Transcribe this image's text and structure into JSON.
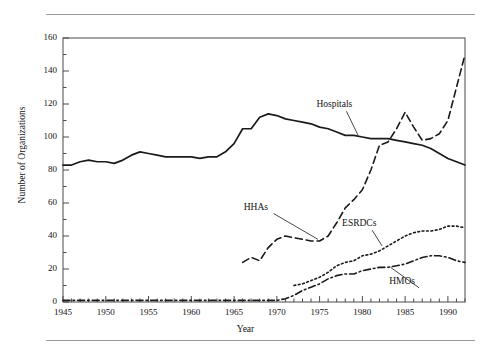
{
  "figure": {
    "ylabel": "Number of Organizations",
    "xlabel": "Year"
  },
  "chart_data": {
    "type": "line",
    "title": "",
    "xlabel": "Year",
    "ylabel": "Number of Organizations",
    "xlim": [
      1945,
      1992
    ],
    "ylim": [
      0,
      160
    ],
    "grid": false,
    "legend_position": "inline-annotations",
    "x_ticks": [
      1945,
      1950,
      1955,
      1960,
      1965,
      1970,
      1975,
      1980,
      1985,
      1990
    ],
    "x_tick_labels": [
      "1945",
      "1950",
      "1955",
      "1960",
      "1965",
      "1970",
      "1975",
      "1980",
      "1985",
      "1990"
    ],
    "x_minor_tick_step": 1,
    "y_ticks": [
      0,
      20,
      40,
      60,
      80,
      100,
      120,
      140,
      160
    ],
    "y_tick_labels": [
      "0",
      "20",
      "40",
      "60",
      "80",
      "100",
      "120",
      "140",
      "160"
    ],
    "y_minor_tick_step": 10,
    "annotations": [
      {
        "label": "Hospitals",
        "x": 1976.5,
        "y": 118,
        "leader_to_x": 1979.5,
        "leader_to_y": 101
      },
      {
        "label": "HHAs",
        "x": 1968.0,
        "y": 56,
        "leader_to_x": 1974.8,
        "leader_to_y": 38
      },
      {
        "label": "ESRDCs",
        "x": 1979.5,
        "y": 46,
        "leader_to_x": 1982.3,
        "leader_to_y": 34
      },
      {
        "label": "HMOs",
        "x": 1985.0,
        "y": 11,
        "leader_to_x": 1983.3,
        "leader_to_y": 21
      }
    ],
    "series": [
      {
        "name": "Hospitals",
        "style": "solid",
        "color": "#1a1a1a",
        "x": [
          1945,
          1946,
          1947,
          1948,
          1949,
          1950,
          1951,
          1952,
          1953,
          1954,
          1955,
          1956,
          1957,
          1958,
          1959,
          1960,
          1961,
          1962,
          1963,
          1964,
          1965,
          1966,
          1967,
          1968,
          1969,
          1970,
          1971,
          1972,
          1973,
          1974,
          1975,
          1976,
          1977,
          1978,
          1979,
          1980,
          1981,
          1982,
          1983,
          1984,
          1985,
          1986,
          1987,
          1988,
          1989,
          1990,
          1991,
          1992
        ],
        "values": [
          83,
          83,
          85,
          86,
          85,
          85,
          84,
          86,
          89,
          91,
          90,
          89,
          88,
          88,
          88,
          88,
          87,
          88,
          88,
          91,
          96,
          105,
          105,
          112,
          114,
          113,
          111,
          110,
          109,
          108,
          106,
          105,
          103,
          101,
          101,
          100,
          99,
          99,
          99,
          98,
          97,
          96,
          95,
          93,
          90,
          87,
          85,
          83
        ]
      },
      {
        "name": "HHAs",
        "style": "dashed",
        "color": "#1a1a1a",
        "x": [
          1966,
          1967,
          1968,
          1969,
          1970,
          1971,
          1972,
          1973,
          1974,
          1975,
          1976,
          1977,
          1978,
          1979,
          1980,
          1981,
          1982,
          1983,
          1984,
          1985,
          1986,
          1987,
          1988,
          1989,
          1990,
          1991,
          1992
        ],
        "values": [
          24,
          27,
          25,
          33,
          38,
          40,
          39,
          38,
          37,
          37,
          40,
          48,
          57,
          62,
          68,
          80,
          95,
          97,
          105,
          115,
          106,
          98,
          99,
          102,
          110,
          130,
          150
        ]
      },
      {
        "name": "ESRDCs",
        "style": "dotted",
        "color": "#1a1a1a",
        "x": [
          1972,
          1973,
          1974,
          1975,
          1976,
          1977,
          1978,
          1979,
          1980,
          1981,
          1982,
          1983,
          1984,
          1985,
          1986,
          1987,
          1988,
          1989,
          1990,
          1991,
          1992
        ],
        "values": [
          10,
          11,
          13,
          15,
          18,
          22,
          24,
          25,
          28,
          29,
          31,
          34,
          37,
          40,
          42,
          43,
          43,
          44,
          46,
          46,
          45
        ]
      },
      {
        "name": "HMOs",
        "style": "dashdot",
        "color": "#1a1a1a",
        "x": [
          1945,
          1950,
          1955,
          1960,
          1963,
          1965,
          1967,
          1968,
          1969,
          1970,
          1971,
          1972,
          1973,
          1974,
          1975,
          1976,
          1977,
          1978,
          1979,
          1980,
          1981,
          1982,
          1983,
          1984,
          1985,
          1986,
          1987,
          1988,
          1989,
          1990,
          1991,
          1992
        ],
        "values": [
          1,
          1,
          1,
          1,
          1,
          1,
          1,
          1,
          1,
          1,
          2,
          4,
          7,
          9,
          11,
          14,
          16,
          17,
          17,
          19,
          20,
          21,
          21,
          22,
          23,
          25,
          27,
          28,
          28,
          27,
          25,
          24
        ]
      }
    ]
  }
}
